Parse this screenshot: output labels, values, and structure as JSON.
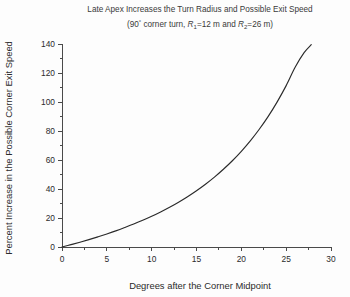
{
  "chart_data": {
    "type": "line",
    "title": "Late Apex Increases the Turn Radius and Possible Exit Speed",
    "subtitle_parts": {
      "open": "(90",
      "degree": "°",
      "mid1": " corner turn, ",
      "r1_sym": "R",
      "r1_sub": "1",
      "r1_val": "=12 m and ",
      "r2_sym": "R",
      "r2_sub": "2",
      "r2_val": "=26 m)"
    },
    "subtitle_plain": "(90° corner turn, R1=12 m and R2=26 m)",
    "xlabel": "Degrees after the Corner Midpoint",
    "ylabel": "Percent Increase in the Possible Corner Exit Speed",
    "xlim": [
      0,
      30
    ],
    "ylim": [
      0,
      145
    ],
    "xticks": [
      0,
      5,
      10,
      15,
      20,
      25,
      30
    ],
    "xtick_labels": [
      "0",
      "5",
      "10",
      "15",
      "20",
      "25",
      "30"
    ],
    "x_minor_step": 2.5,
    "yticks": [
      0,
      20,
      40,
      60,
      80,
      100,
      120,
      140
    ],
    "ytick_labels": [
      "0",
      "20",
      "40",
      "60",
      "80",
      "100",
      "120",
      "140"
    ],
    "y_minor_step": 10,
    "grid": false,
    "legend": null,
    "series": [
      {
        "name": "Percent increase in exit speed",
        "color": "#2a2a2a",
        "x": [
          0,
          1,
          2,
          3,
          4,
          5,
          6,
          7,
          8,
          9,
          10,
          11,
          12,
          13,
          14,
          15,
          16,
          17,
          18,
          19,
          20,
          21,
          22,
          23,
          24,
          25,
          26,
          27,
          27.8
        ],
        "y": [
          0,
          1.6,
          3.3,
          5.1,
          7.0,
          9.0,
          11.1,
          13.4,
          15.8,
          18.4,
          21.2,
          24.2,
          27.4,
          30.9,
          34.7,
          38.8,
          43.3,
          48.2,
          53.6,
          59.5,
          66.0,
          73.2,
          81.2,
          90.1,
          100.1,
          111.3,
          123.9,
          134.0,
          139.5
        ]
      }
    ]
  }
}
